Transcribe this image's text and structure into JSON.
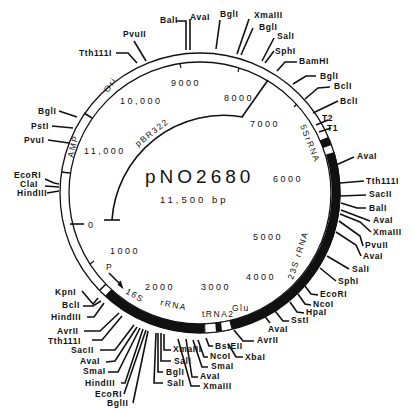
{
  "plasmid": {
    "name": "pNO2680",
    "size": "11,500 bp",
    "vector_label": "pBR322"
  },
  "scale_marks": [
    {
      "label": "0",
      "x": 88,
      "y": 228
    },
    {
      "label": "1000",
      "x": 110,
      "y": 254
    },
    {
      "label": "2000",
      "x": 145,
      "y": 290
    },
    {
      "label": "3000",
      "x": 201,
      "y": 288
    },
    {
      "label": "4000",
      "x": 246,
      "y": 279
    },
    {
      "label": "5000",
      "x": 253,
      "y": 240
    },
    {
      "label": "6000",
      "x": 273,
      "y": 182
    },
    {
      "label": "7000",
      "x": 250,
      "y": 127
    },
    {
      "label": "8000",
      "x": 224,
      "y": 101
    },
    {
      "label": "9000",
      "x": 171,
      "y": 86
    },
    {
      "label": "10,000",
      "x": 120,
      "y": 104
    },
    {
      "label": "11,000",
      "x": 80,
      "y": 151
    }
  ],
  "genes": {
    "ori": "Ori",
    "amp": "AMP",
    "r5s": "5SrRNA",
    "r23s": "23S rRNA",
    "r16s": "16S",
    "r16s_rrna": "rRNA",
    "trna": "tRNA2",
    "trna_glu": "Glu",
    "promoter": "P",
    "t1": "T1",
    "t2": "T2"
  },
  "sites_top": [
    {
      "name": "Tth111I"
    },
    {
      "name": "PvuII"
    },
    {
      "name": "BalI"
    },
    {
      "name": "AvaI"
    },
    {
      "name": "BglI"
    },
    {
      "name": "XmaIII"
    },
    {
      "name": "BglI"
    },
    {
      "name": "SalI"
    },
    {
      "name": "SphI"
    },
    {
      "name": "BamHI"
    },
    {
      "name": "BglI"
    },
    {
      "name": "BclI"
    },
    {
      "name": "BclI"
    }
  ],
  "sites_left": [
    {
      "name": "BglI"
    },
    {
      "name": "PstI"
    },
    {
      "name": "PvuI"
    },
    {
      "name": "EcoRI"
    },
    {
      "name": "ClaI"
    },
    {
      "name": "HindIII"
    }
  ],
  "sites_right": [
    {
      "name": "AvaI"
    },
    {
      "name": "Tth111I"
    },
    {
      "name": "SacII"
    },
    {
      "name": "BalI"
    },
    {
      "name": "AvaI"
    },
    {
      "name": "XmaIII"
    },
    {
      "name": "PvuII"
    },
    {
      "name": "AvaI"
    },
    {
      "name": "SalI"
    },
    {
      "name": "SphI"
    },
    {
      "name": "EcoRI"
    },
    {
      "name": "NcoI"
    },
    {
      "name": "HpaI"
    },
    {
      "name": "SstI"
    },
    {
      "name": "AvaI"
    },
    {
      "name": "AvrII"
    }
  ],
  "sites_bottom": [
    {
      "name": "KpnI"
    },
    {
      "name": "BclI"
    },
    {
      "name": "HindIII"
    },
    {
      "name": "AvrII"
    },
    {
      "name": "Tth111I"
    },
    {
      "name": "SacII"
    },
    {
      "name": "AvaI"
    },
    {
      "name": "SmaI"
    },
    {
      "name": "HindIII"
    },
    {
      "name": "EcoRI"
    },
    {
      "name": "BglII"
    },
    {
      "name": "XmaIII"
    },
    {
      "name": "SalI"
    },
    {
      "name": "BglI"
    },
    {
      "name": "SalI"
    },
    {
      "name": "BstEII"
    },
    {
      "name": "NcoI"
    },
    {
      "name": "XbaI"
    },
    {
      "name": "SmaI"
    },
    {
      "name": "AvaI"
    },
    {
      "name": "XmaIII"
    }
  ]
}
